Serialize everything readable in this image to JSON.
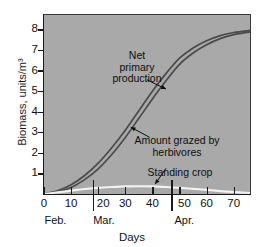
{
  "chart_data": {
    "type": "line",
    "title": "",
    "xlabel": "Days",
    "ylabel": "Biomass, units/m³",
    "xlim": [
      0,
      76
    ],
    "ylim": [
      0,
      8.7
    ],
    "grid": false,
    "legend_position": "inline-annotations",
    "background_color": "#a9a9a9",
    "x_ticks": [
      0,
      10,
      20,
      30,
      40,
      50,
      60,
      70
    ],
    "x_tick_labels": [
      "0",
      "10",
      "20",
      "30",
      "40",
      "50",
      "60",
      "70"
    ],
    "y_ticks": [
      1,
      2,
      3,
      4,
      5,
      6,
      7,
      8
    ],
    "y_tick_labels": [
      "1",
      "2",
      "3",
      "4",
      "5",
      "6",
      "7",
      "8"
    ],
    "month_bands": [
      {
        "label": "Feb.",
        "start": 0,
        "end": 18,
        "tick_label_x": 2
      },
      {
        "label": "Mar.",
        "start": 18,
        "end": 47,
        "tick_label_x": 20
      },
      {
        "label": "Apr.",
        "start": 47,
        "end": 76,
        "tick_label_x": 50
      }
    ],
    "series": [
      {
        "name": "Net primary production",
        "color": "#4a4a4a",
        "x": [
          0,
          5,
          10,
          15,
          20,
          25,
          30,
          35,
          40,
          45,
          50,
          55,
          60,
          65,
          70,
          76
        ],
        "values": [
          0.0,
          0.15,
          0.45,
          0.9,
          1.5,
          2.25,
          3.1,
          4.05,
          5.0,
          5.85,
          6.6,
          7.1,
          7.45,
          7.7,
          7.85,
          7.95
        ]
      },
      {
        "name": "Amount grazed by herbivores",
        "color": "#4a4a4a",
        "x": [
          0,
          5,
          10,
          15,
          20,
          25,
          30,
          35,
          40,
          45,
          50,
          55,
          60,
          65,
          70,
          76
        ],
        "values": [
          0.0,
          0.1,
          0.32,
          0.7,
          1.22,
          1.92,
          2.75,
          3.68,
          4.62,
          5.5,
          6.3,
          6.85,
          7.25,
          7.55,
          7.75,
          7.88
        ]
      },
      {
        "name": "Standing crop",
        "color": "#f2f2f2",
        "x": [
          0,
          5,
          10,
          15,
          20,
          25,
          30,
          35,
          40,
          45,
          50,
          55,
          60,
          65,
          70,
          76
        ],
        "values": [
          0.0,
          0.08,
          0.16,
          0.24,
          0.3,
          0.34,
          0.37,
          0.38,
          0.37,
          0.34,
          0.3,
          0.25,
          0.2,
          0.14,
          0.09,
          0.05
        ]
      }
    ],
    "annotations": [
      {
        "id": "net-primary-production",
        "text_lines": [
          "Net",
          "primary",
          "production"
        ],
        "text": "Net primary production",
        "pointer_from_x": 38,
        "pointer_from_y": 5.55,
        "pointer_to_x": 45,
        "pointer_to_y": 5.1
      },
      {
        "id": "amount-grazed-by-herbivores",
        "text_lines": [
          "Amount grazed by",
          "herbivores"
        ],
        "text": "Amount grazed by herbivores",
        "pointer_from_x": 39,
        "pointer_from_y": 2.75,
        "pointer_to_x": 32,
        "pointer_to_y": 3.25
      },
      {
        "id": "standing-crop",
        "text_lines": [
          "Standing crop"
        ],
        "text": "Standing crop",
        "pointer_from_x": 45,
        "pointer_from_y": 1.25,
        "pointer_to_x": 41,
        "pointer_to_y": 0.48
      }
    ]
  }
}
